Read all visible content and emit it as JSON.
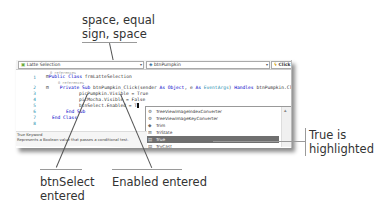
{
  "callouts": {
    "top": "space, equal sign, space",
    "top_line1": "space, equal",
    "top_line2": "sign, space",
    "right_line1": "True is",
    "right_line2": "highlighted",
    "bottom_left_line1": "btnSelect",
    "bottom_left_line2": "entered",
    "bottom_mid": "Enabled entered"
  },
  "editor": {
    "toolbar": {
      "class_dropdown": "Latte Selection",
      "class_icon": "class-icon",
      "member_dropdown": "btnPumpkin",
      "member_icon": "field-icon",
      "event_dropdown": "Click",
      "event_icon": "event-icon"
    },
    "lines": [
      {
        "num": "",
        "text": "0 references",
        "kind": "ref"
      },
      {
        "num": "1",
        "text": "Public Class frmLatteSelection"
      },
      {
        "num": "",
        "text": "0 references",
        "kind": "ref"
      },
      {
        "num": "2",
        "text": "Private Sub btnPumpkin_Click(sender As Object, e As EventArgs) Handles btnPumpkin.Cl"
      },
      {
        "num": "3",
        "text": "picPumpkin.Visible = True"
      },
      {
        "num": "4",
        "text": "picMocha.Visible = False"
      },
      {
        "num": "5",
        "text": "btnSelect.Enabled = T"
      },
      {
        "num": "6",
        "text": "End Sub"
      },
      {
        "num": "7",
        "text": "End Class"
      },
      {
        "num": "8",
        "text": ""
      }
    ],
    "intellisense": {
      "items": [
        {
          "label": "TreeViewImageIndexConverter",
          "icon": "class-icon"
        },
        {
          "label": "TreeViewImageKeyConverter",
          "icon": "class-icon"
        },
        {
          "label": "Trim",
          "icon": "method-icon"
        },
        {
          "label": "TriState",
          "icon": "enum-icon"
        },
        {
          "label": "True",
          "icon": "keyword-icon",
          "selected": true
        },
        {
          "label": "TryCast",
          "icon": "keyword-icon"
        }
      ]
    },
    "status": {
      "line1": "True Keyword",
      "line2": "Represents a Boolean value that passes a conditional test."
    }
  }
}
